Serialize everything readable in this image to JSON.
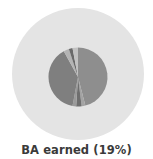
{
  "caption": "BA earned (19%)",
  "colors": {
    "outer_ring": "#e4e4e4",
    "background": "#ffffff"
  },
  "chart_data": {
    "type": "pie",
    "title": "BA earned (19%)",
    "outer": {
      "label": "All",
      "value": 100,
      "color": "#e4e4e4"
    },
    "inner_highlight_percent": 19,
    "slices": [
      {
        "label": "segment-1",
        "value": 46,
        "color": "#8e8e8e"
      },
      {
        "label": "segment-2",
        "value": 2,
        "color": "#a3a3a3"
      },
      {
        "label": "segment-3",
        "value": 3,
        "color": "#6e6e6e"
      },
      {
        "label": "segment-4",
        "value": 2,
        "color": "#9a9a9a"
      },
      {
        "label": "segment-5",
        "value": 39,
        "color": "#7f7f7f"
      },
      {
        "label": "segment-6",
        "value": 3,
        "color": "#b4b4b4"
      },
      {
        "label": "segment-7",
        "value": 2,
        "color": "#6a6a6a"
      },
      {
        "label": "segment-8",
        "value": 3,
        "color": "#c2c2c2"
      }
    ],
    "legend": "none",
    "grid": false
  }
}
